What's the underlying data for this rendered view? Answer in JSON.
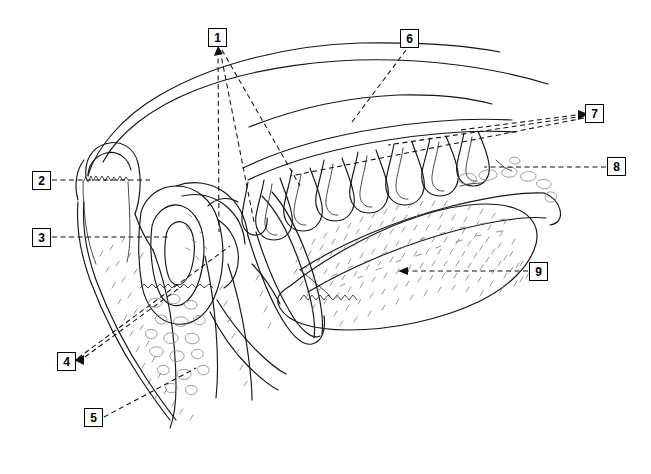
{
  "figure": {
    "background_color": "#ffffff",
    "line_color": "#141414",
    "texture_color": "#8a8a8a",
    "leader_color": "#111111",
    "width": 651,
    "height": 474
  },
  "labels": [
    {
      "id": "1",
      "text": "1",
      "x": 208,
      "y": 28
    },
    {
      "id": "2",
      "text": "2",
      "x": 32,
      "y": 171
    },
    {
      "id": "3",
      "text": "3",
      "x": 32,
      "y": 228
    },
    {
      "id": "4",
      "text": "4",
      "x": 57,
      "y": 352
    },
    {
      "id": "5",
      "text": "5",
      "x": 84,
      "y": 408
    },
    {
      "id": "6",
      "text": "6",
      "x": 400,
      "y": 29
    },
    {
      "id": "7",
      "text": "7",
      "x": 585,
      "y": 104
    },
    {
      "id": "8",
      "text": "8",
      "x": 607,
      "y": 157
    },
    {
      "id": "9",
      "text": "9",
      "x": 529,
      "y": 262
    }
  ]
}
